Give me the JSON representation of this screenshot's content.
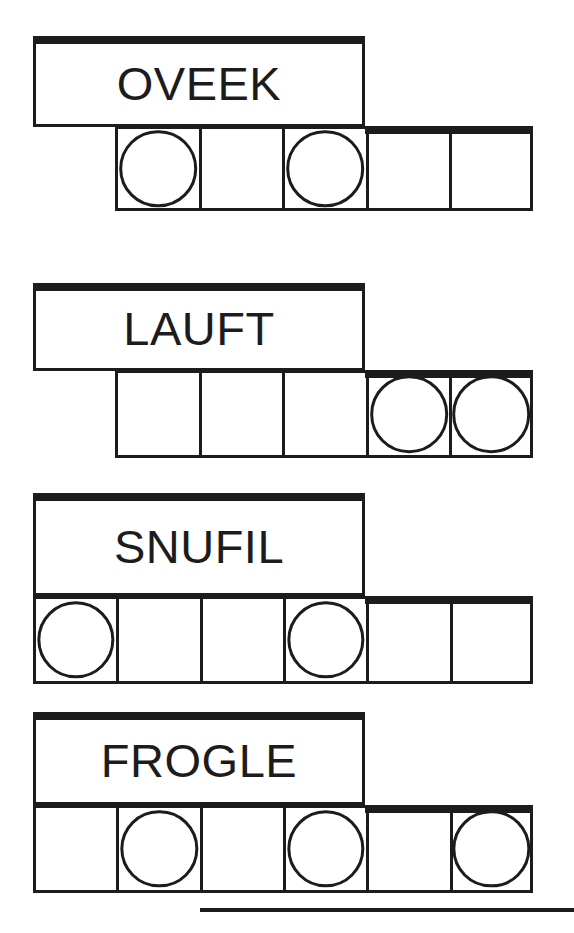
{
  "sheet": {
    "title": "Word Puzzle Worksheet",
    "width": 574,
    "height": 933,
    "ink_color": "#1c1c1c",
    "paper_color": "#ffffff"
  },
  "puzzles": [
    {
      "id": "puzzle-1",
      "word": "OVEEK",
      "cell_count": 5,
      "circle_positions": [
        1,
        3
      ],
      "cells": [
        {
          "index": 1,
          "has_circle": true,
          "value": ""
        },
        {
          "index": 2,
          "has_circle": false,
          "value": ""
        },
        {
          "index": 3,
          "has_circle": true,
          "value": ""
        },
        {
          "index": 4,
          "has_circle": false,
          "value": ""
        },
        {
          "index": 5,
          "has_circle": false,
          "value": ""
        }
      ],
      "word_box": {
        "x": 33,
        "y": 36,
        "width": 332,
        "height": 91
      },
      "cell_row": {
        "x": 115,
        "y": 126,
        "width": 418,
        "height": 85
      },
      "cap": {
        "x": 365,
        "y": 126,
        "width": 168
      }
    },
    {
      "id": "puzzle-2",
      "word": "LAUFT",
      "cell_count": 5,
      "circle_positions": [
        4,
        5
      ],
      "cells": [
        {
          "index": 1,
          "has_circle": false,
          "value": ""
        },
        {
          "index": 2,
          "has_circle": false,
          "value": ""
        },
        {
          "index": 3,
          "has_circle": false,
          "value": ""
        },
        {
          "index": 4,
          "has_circle": true,
          "value": ""
        },
        {
          "index": 5,
          "has_circle": true,
          "value": ""
        }
      ],
      "word_box": {
        "x": 33,
        "y": 283,
        "width": 332,
        "height": 88
      },
      "cell_row": {
        "x": 115,
        "y": 370,
        "width": 418,
        "height": 88
      },
      "cap": {
        "x": 365,
        "y": 370,
        "width": 168
      }
    },
    {
      "id": "puzzle-3",
      "word": "SNUFIL",
      "cell_count": 6,
      "circle_positions": [
        1,
        4
      ],
      "cells": [
        {
          "index": 1,
          "has_circle": true,
          "value": ""
        },
        {
          "index": 2,
          "has_circle": false,
          "value": ""
        },
        {
          "index": 3,
          "has_circle": false,
          "value": ""
        },
        {
          "index": 4,
          "has_circle": true,
          "value": ""
        },
        {
          "index": 5,
          "has_circle": false,
          "value": ""
        },
        {
          "index": 6,
          "has_circle": false,
          "value": ""
        }
      ],
      "word_box": {
        "x": 33,
        "y": 493,
        "width": 332,
        "height": 103
      },
      "cell_row": {
        "x": 33,
        "y": 596,
        "width": 500,
        "height": 88
      },
      "cap": {
        "x": 365,
        "y": 596,
        "width": 168
      }
    },
    {
      "id": "puzzle-4",
      "word": "FROGLE",
      "cell_count": 6,
      "circle_positions": [
        2,
        4,
        6
      ],
      "cells": [
        {
          "index": 1,
          "has_circle": false,
          "value": ""
        },
        {
          "index": 2,
          "has_circle": true,
          "value": ""
        },
        {
          "index": 3,
          "has_circle": false,
          "value": ""
        },
        {
          "index": 4,
          "has_circle": true,
          "value": ""
        },
        {
          "index": 5,
          "has_circle": false,
          "value": ""
        },
        {
          "index": 6,
          "has_circle": true,
          "value": ""
        }
      ],
      "word_box": {
        "x": 33,
        "y": 712,
        "width": 332,
        "height": 93
      },
      "cell_row": {
        "x": 33,
        "y": 805,
        "width": 500,
        "height": 88
      },
      "cap": {
        "x": 365,
        "y": 805,
        "width": 168
      }
    }
  ],
  "bottom_rule": {
    "x": 200,
    "y": 908,
    "width": 374,
    "height": 4
  }
}
